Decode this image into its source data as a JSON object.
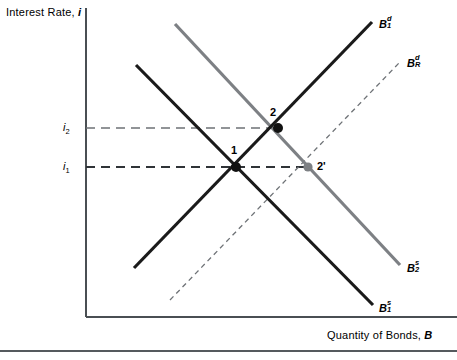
{
  "figure": {
    "type": "economics-supply-demand-diagram",
    "axes": {
      "y_title_prefix": "Interest Rate, ",
      "y_title_var": "i",
      "x_title_prefix": "Quantity of Bonds, ",
      "x_title_var": "B",
      "y_axis_x_px": 86,
      "x_axis_y_px": 317,
      "plot_right_px": 457,
      "plot_top_px": 8
    },
    "tick_labels": [
      {
        "id": "i2",
        "base": "i",
        "sub": "2",
        "x": 63,
        "y": 122,
        "value_px_y": 128
      },
      {
        "id": "i1",
        "base": "i",
        "sub": "1",
        "x": 63,
        "y": 161,
        "value_px_y": 167
      }
    ],
    "curves": [
      {
        "id": "B1d",
        "base": "B",
        "sup": "d",
        "sub": "1",
        "style": "solid",
        "color": "#1a1a1a",
        "width": 3.2,
        "x1": 134,
        "y1": 268,
        "x2": 372,
        "y2": 22,
        "label_x": 379,
        "label_y": 17
      },
      {
        "id": "BRd",
        "base": "B",
        "sup": "d",
        "sub": "R",
        "style": "dashed",
        "color": "#6e7276",
        "width": 1.3,
        "x1": 170,
        "y1": 300,
        "x2": 400,
        "y2": 62,
        "label_x": 407,
        "label_y": 56
      },
      {
        "id": "B1s",
        "base": "B",
        "sup": "s",
        "sub": "1",
        "style": "solid",
        "color": "#1a1a1a",
        "width": 3.2,
        "x1": 136,
        "y1": 65,
        "x2": 373,
        "y2": 305,
        "label_x": 379,
        "label_y": 301
      },
      {
        "id": "B2s",
        "base": "B",
        "sup": "s",
        "sub": "2",
        "style": "solid",
        "color": "#7d8084",
        "width": 3.2,
        "x1": 175,
        "y1": 24,
        "x2": 400,
        "y2": 265,
        "label_x": 407,
        "label_y": 261
      }
    ],
    "equilibria": [
      {
        "id": "1",
        "label": "1",
        "x": 236,
        "y": 167,
        "color": "#111111",
        "r": 5.0,
        "label_x": 231,
        "label_y": 145
      },
      {
        "id": "2",
        "label": "2",
        "x": 278,
        "y": 128,
        "color": "#111111",
        "r": 5.0,
        "label_x": 270,
        "label_y": 107
      },
      {
        "id": "2p",
        "label": "2'",
        "x": 308,
        "y": 167,
        "color": "#7d8084",
        "r": 4.6,
        "label_x": 317,
        "label_y": 161
      }
    ],
    "guide_lines": [
      {
        "id": "i2-guide",
        "from_x": 86,
        "to_x": 278,
        "y": 128,
        "color": "#6e7276"
      },
      {
        "id": "i1-guide",
        "from_x": 86,
        "to_x": 308,
        "y": 167,
        "color": "#333333"
      }
    ],
    "footer_rule": {
      "y": 350,
      "height": 1.5,
      "color": "#555a5e"
    }
  }
}
